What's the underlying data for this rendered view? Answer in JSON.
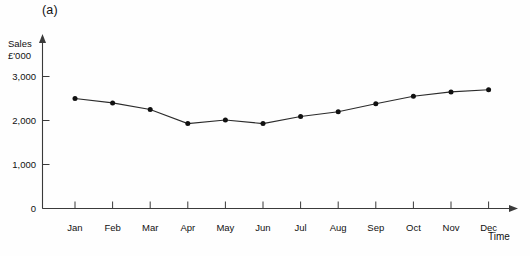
{
  "figure": {
    "panel_label": "(a)"
  },
  "chart_data": {
    "type": "line",
    "title": "(a)",
    "xlabel": "Time",
    "ylabel": "Sales £'000",
    "ylabel_lines": [
      "Sales",
      "£'000"
    ],
    "categories": [
      "Jan",
      "Feb",
      "Mar",
      "Apr",
      "May",
      "Jun",
      "Jul",
      "Aug",
      "Sep",
      "Oct",
      "Nov",
      "Dec"
    ],
    "values": [
      2500,
      2400,
      2250,
      1930,
      2010,
      1930,
      2090,
      2200,
      2380,
      2550,
      2650,
      2700
    ],
    "series": [
      {
        "name": "Sales",
        "values": [
          2500,
          2400,
          2250,
          1930,
          2010,
          1930,
          2090,
          2200,
          2380,
          2550,
          2650,
          2700
        ]
      }
    ],
    "ylim": [
      0,
      3100
    ],
    "yticks": [
      0,
      1000,
      2000,
      3000
    ],
    "ytick_labels": [
      "0",
      "1,000",
      "2,000",
      "3,000"
    ],
    "grid": false,
    "legend": "none",
    "marker": "filled-circle",
    "line_color": "#2b2b2b",
    "marker_color": "#111111",
    "axis_color": "#3a3a3a",
    "background_color": "#fefefe"
  }
}
